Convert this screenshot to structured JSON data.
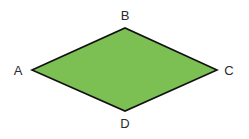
{
  "diagram": {
    "shape": "rhombus",
    "vertices": [
      {
        "id": "A",
        "label": "A"
      },
      {
        "id": "B",
        "label": "B"
      },
      {
        "id": "C",
        "label": "C"
      },
      {
        "id": "D",
        "label": "D"
      }
    ],
    "colors": {
      "fill": "#7cbf52",
      "stroke": "#111111"
    }
  }
}
